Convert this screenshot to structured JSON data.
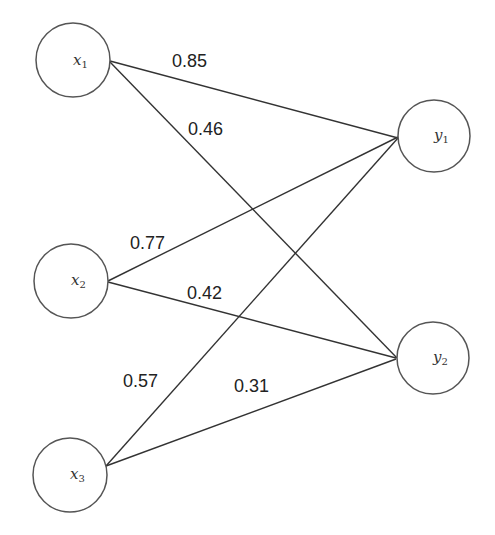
{
  "diagram": {
    "type": "bipartite-neural-network",
    "inputs": [
      {
        "id": "x1",
        "base": "x",
        "sub": "1"
      },
      {
        "id": "x2",
        "base": "x",
        "sub": "2"
      },
      {
        "id": "x3",
        "base": "x",
        "sub": "3"
      }
    ],
    "outputs": [
      {
        "id": "y1",
        "base": "y",
        "sub": "1"
      },
      {
        "id": "y2",
        "base": "y",
        "sub": "2"
      }
    ],
    "edges": [
      {
        "from": "x1",
        "to": "y1",
        "weight": "0.85"
      },
      {
        "from": "x1",
        "to": "y2",
        "weight": "0.46"
      },
      {
        "from": "x2",
        "to": "y1",
        "weight": "0.77"
      },
      {
        "from": "x2",
        "to": "y2",
        "weight": "0.42"
      },
      {
        "from": "x3",
        "to": "y1",
        "weight": "0.57"
      },
      {
        "from": "x3",
        "to": "y2",
        "weight": "0.31"
      }
    ]
  }
}
